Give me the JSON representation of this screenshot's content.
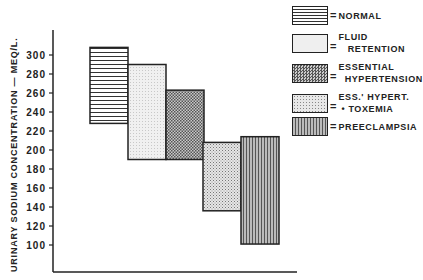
{
  "chart_data": {
    "type": "bar",
    "subtype": "floating-range-bar",
    "title": "",
    "xlabel": "",
    "ylabel": "URINARY SODIUM CONCENTRATION — MEQ/L.",
    "ylim": [
      80,
      320
    ],
    "yticks": [
      100,
      120,
      140,
      160,
      180,
      200,
      220,
      240,
      260,
      280,
      300
    ],
    "grid": false,
    "legend_position": "top-right",
    "categories": [
      "NORMAL",
      "FLUID RETENTION",
      "ESSENTIAL HYPERTENSION",
      "ESS. HYPERT. + TOXEMIA",
      "PREECLAMPSIA"
    ],
    "series": [
      {
        "name": "NORMAL",
        "low": 228,
        "high": 308,
        "pattern": "horizontal-lines"
      },
      {
        "name": "FLUID RETENTION",
        "low": 190,
        "high": 290,
        "pattern": "light-stipple"
      },
      {
        "name": "ESSENTIAL HYPERTENSION",
        "low": 190,
        "high": 263,
        "pattern": "crosshatch"
      },
      {
        "name": "ESS. HYPERT. + TOXEMIA",
        "low": 136,
        "high": 208,
        "pattern": "dots"
      },
      {
        "name": "PREECLAMPSIA",
        "low": 101,
        "high": 214,
        "pattern": "vertical-lines"
      }
    ]
  },
  "legend": {
    "items": [
      {
        "label": "NORMAL",
        "pattern": "hlines"
      },
      {
        "label": "FLUID\n   RETENTION",
        "pattern": "light"
      },
      {
        "label": "ESSENTIAL\n  HYPERTENSION",
        "pattern": "cross"
      },
      {
        "label": "ESS.' HYPERT.\n • TOXEMIA",
        "pattern": "dots"
      },
      {
        "label": "PREECLAMPSIA",
        "pattern": "vlines"
      }
    ],
    "equals": "="
  },
  "axis": {
    "y_title": "URINARY  SODIUM  CONCENTRATION — MEQ/L."
  }
}
